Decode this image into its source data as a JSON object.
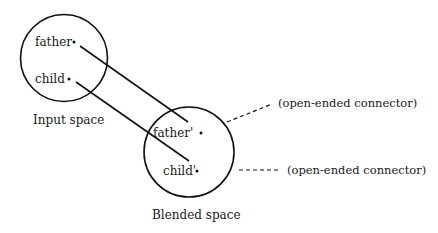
{
  "diagram": {
    "type": "conceptual-blending",
    "colors": {
      "stroke": "#111111",
      "text": "#1a1a1a",
      "background": "#ffffff"
    },
    "spaces": [
      {
        "name": "Input space",
        "elements": [
          {
            "label": "father"
          },
          {
            "label": "child"
          }
        ]
      },
      {
        "name": "Blended space",
        "elements": [
          {
            "label": "father'"
          },
          {
            "label": "child'"
          }
        ]
      }
    ],
    "connectors": [
      {
        "from": "father",
        "to": "father'",
        "style": "solid"
      },
      {
        "from": "child",
        "to": "child'",
        "style": "solid"
      }
    ],
    "open_ended": [
      {
        "label": "(open-ended connector)",
        "from": "father'"
      },
      {
        "label": "(open-ended connector)",
        "from": "child'"
      }
    ]
  }
}
